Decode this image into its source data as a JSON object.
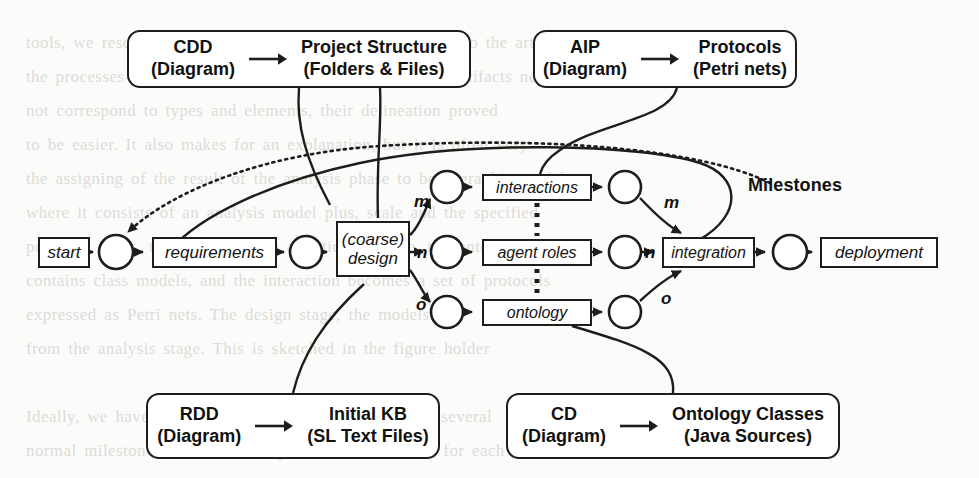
{
  "diagram": {
    "title_label": "Milestones",
    "background_text": "tools, we resort to the outcomes of these phases, that is, to the artifacts\nthe processes produce, for process modelling. Since the artifacts need\nnot correspond to types and elements, their delineation proved\nto be easier. It also makes for an explanation, but it is often very\nthe assigning of the result of the analysis phase to be a graphic model,\nwhere it consists of an analysis model plus, scale and the specified\npotential. Thus, the latter become a static rule base, the ontology\ncontains class models, and the interaction becomes a set of protocols\nexpressed as Petri nets. The design stage, the models are\nfrom the analysis stage. This is sketched in the figure holder\n\nIdeally, we have to verify the initial model comprises several\nnormal milestones, and the concept we have to define for each of\nthese models how they are transformed into the corresponding\nimplementation artifacts. This diagram is a generic model for\nthe model-driven implementation of agent systems."
  },
  "nodes": [
    {
      "id": "start",
      "label": "start",
      "x": 38,
      "y": 237,
      "w": 52,
      "h": 31
    },
    {
      "id": "requirements",
      "label": "requirements",
      "x": 152,
      "y": 237,
      "w": 125,
      "h": 31
    },
    {
      "id": "coarse-design",
      "label": "(coarse)\ndesign",
      "line1": "(coarse)",
      "line2": "design",
      "x": 336,
      "y": 221,
      "w": 74,
      "h": 56
    },
    {
      "id": "interactions",
      "label": "interactions",
      "x": 482,
      "y": 174,
      "w": 110,
      "h": 27
    },
    {
      "id": "agent-roles",
      "label": "agent roles",
      "x": 482,
      "y": 239,
      "w": 110,
      "h": 27
    },
    {
      "id": "ontology",
      "label": "ontology",
      "x": 482,
      "y": 299,
      "w": 110,
      "h": 27
    },
    {
      "id": "integration",
      "label": "integration",
      "x": 662,
      "y": 237,
      "w": 93,
      "h": 31
    },
    {
      "id": "deployment",
      "label": "deployment",
      "x": 820,
      "y": 237,
      "w": 118,
      "h": 31
    }
  ],
  "places": [
    {
      "id": "place-after-start",
      "cx": 116,
      "cy": 252,
      "r": 17
    },
    {
      "id": "place-after-requirements",
      "cx": 306,
      "cy": 252,
      "r": 16
    },
    {
      "id": "place-before-interactions",
      "cx": 447,
      "cy": 187,
      "r": 16
    },
    {
      "id": "place-before-agent-roles",
      "cx": 447,
      "cy": 252,
      "r": 16
    },
    {
      "id": "place-before-ontology",
      "cx": 447,
      "cy": 312,
      "r": 16
    },
    {
      "id": "place-after-interactions",
      "cx": 625,
      "cy": 187,
      "r": 16
    },
    {
      "id": "place-after-agent-roles",
      "cx": 625,
      "cy": 252,
      "r": 16
    },
    {
      "id": "place-after-ontology",
      "cx": 625,
      "cy": 312,
      "r": 16
    },
    {
      "id": "place-after-integration",
      "cx": 790,
      "cy": 252,
      "r": 17
    }
  ],
  "edge_labels": [
    {
      "id": "m-left",
      "text": "m",
      "x": 414,
      "y": 192
    },
    {
      "id": "n-left",
      "text": "n",
      "x": 417,
      "y": 243
    },
    {
      "id": "o-left",
      "text": "o",
      "x": 416,
      "y": 295
    },
    {
      "id": "m-right",
      "text": "m",
      "x": 664,
      "y": 193
    },
    {
      "id": "n-right",
      "text": "n",
      "x": 645,
      "y": 243
    },
    {
      "id": "o-right",
      "text": "o",
      "x": 661,
      "y": 289
    }
  ],
  "annotations": [
    {
      "id": "cdd-annotation",
      "left_line1": "CDD",
      "left_line2": "(Diagram)",
      "right_line1": "Project Structure",
      "right_line2": "(Folders & Files)",
      "x": 127,
      "y": 30,
      "w": 344,
      "h": 58
    },
    {
      "id": "aip-annotation",
      "left_line1": "AIP",
      "left_line2": "(Diagram)",
      "right_line1": "Protocols",
      "right_line2": "(Petri nets)",
      "x": 533,
      "y": 30,
      "w": 264,
      "h": 58
    },
    {
      "id": "rdd-annotation",
      "left_line1": "RDD",
      "left_line2": "(Diagram)",
      "right_line1": "Initial KB",
      "right_line2": "(SL Text Files)",
      "x": 146,
      "y": 393,
      "w": 294,
      "h": 66
    },
    {
      "id": "cd-annotation",
      "left_line1": "CD",
      "left_line2": "(Diagram)",
      "right_line1": "Ontology Classes",
      "right_line2": "(Java Sources)",
      "x": 506,
      "y": 393,
      "w": 334,
      "h": 66
    }
  ],
  "colors": {
    "stroke": "#1d1d1b",
    "fill": "#ffffff",
    "text": "#121210",
    "page": "#fbfbf9"
  },
  "icons": {
    "transform_arrow": "right-arrow-icon",
    "token_flow": "arrowhead-icon"
  }
}
